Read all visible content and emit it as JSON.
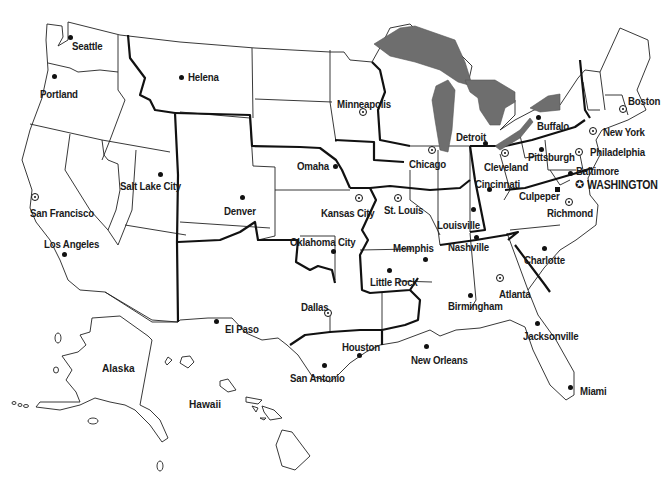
{
  "map": {
    "title": "",
    "regions": [
      {
        "label": "Alaska",
        "x": 102,
        "y": 362
      },
      {
        "label": "Hawaii",
        "x": 189,
        "y": 398
      }
    ],
    "cities": [
      {
        "name": "Seattle",
        "marker": "dot",
        "dot": [
          70,
          37
        ],
        "label": [
          72,
          40
        ]
      },
      {
        "name": "Portland",
        "marker": "dot",
        "dot": [
          54,
          76
        ],
        "label": [
          40,
          88
        ]
      },
      {
        "name": "Helena",
        "marker": "dot",
        "dot": [
          181,
          77
        ],
        "label": [
          188,
          71
        ]
      },
      {
        "name": "Salt Lake City",
        "marker": "dot",
        "dot": [
          160,
          174
        ],
        "label": [
          120,
          180
        ]
      },
      {
        "name": "San Francisco",
        "marker": "ring",
        "dot": [
          35,
          197
        ],
        "label": [
          30,
          207
        ]
      },
      {
        "name": "Los Angeles",
        "marker": "dot",
        "dot": [
          64,
          254
        ],
        "label": [
          44,
          238
        ]
      },
      {
        "name": "Denver",
        "marker": "dot",
        "dot": [
          242,
          197
        ],
        "label": [
          224,
          205
        ]
      },
      {
        "name": "Omaha",
        "marker": "dot",
        "dot": [
          335,
          166
        ],
        "label": [
          297,
          160
        ]
      },
      {
        "name": "Kansas City",
        "marker": "ring",
        "dot": [
          359,
          198
        ],
        "label": [
          321,
          207
        ]
      },
      {
        "name": "Oklahoma City",
        "marker": "dot",
        "dot": [
          333,
          251
        ],
        "label": [
          290,
          236
        ]
      },
      {
        "name": "Dallas",
        "marker": "ring",
        "dot": [
          328,
          313
        ],
        "label": [
          301,
          301
        ]
      },
      {
        "name": "El Paso",
        "marker": "dot",
        "dot": [
          216,
          321
        ],
        "label": [
          225,
          323
        ]
      },
      {
        "name": "San Antonio",
        "marker": "dot",
        "dot": [
          324,
          365
        ],
        "label": [
          290,
          372
        ]
      },
      {
        "name": "Houston",
        "marker": "dot",
        "dot": [
          359,
          355
        ],
        "label": [
          342,
          341
        ]
      },
      {
        "name": "New Orleans",
        "marker": "dot",
        "dot": [
          426,
          346
        ],
        "label": [
          411,
          354
        ]
      },
      {
        "name": "Minneapolis",
        "marker": "ring",
        "dot": [
          363,
          112
        ],
        "label": [
          337,
          98
        ]
      },
      {
        "name": "Chicago",
        "marker": "ring",
        "dot": [
          432,
          150
        ],
        "label": [
          409,
          158
        ]
      },
      {
        "name": "Detroit",
        "marker": "dot",
        "dot": [
          485,
          143
        ],
        "label": [
          456,
          131
        ]
      },
      {
        "name": "St. Louis",
        "marker": "ring",
        "dot": [
          398,
          198
        ],
        "label": [
          384,
          204
        ]
      },
      {
        "name": "Louisville",
        "marker": "dot",
        "dot": [
          473,
          209
        ],
        "label": [
          437,
          219
        ]
      },
      {
        "name": "Memphis",
        "marker": "dot",
        "dot": [
          425,
          259
        ],
        "label": [
          393,
          242
        ]
      },
      {
        "name": "Little Rock",
        "marker": "dot",
        "dot": [
          389,
          270
        ],
        "label": [
          370,
          276
        ]
      },
      {
        "name": "Nashville",
        "marker": "dot",
        "dot": [
          476,
          237
        ],
        "label": [
          448,
          241
        ]
      },
      {
        "name": "Birmingham",
        "marker": "dot",
        "dot": [
          470,
          295
        ],
        "label": [
          448,
          300
        ]
      },
      {
        "name": "Atlanta",
        "marker": "ring",
        "dot": [
          500,
          278
        ],
        "label": [
          499,
          288
        ]
      },
      {
        "name": "Charlotte",
        "marker": "dot",
        "dot": [
          544,
          248
        ],
        "label": [
          524,
          254
        ]
      },
      {
        "name": "Jacksonville",
        "marker": "dot",
        "dot": [
          537,
          323
        ],
        "label": [
          523,
          330
        ]
      },
      {
        "name": "Miami",
        "marker": "dot",
        "dot": [
          570,
          387
        ],
        "label": [
          580,
          385
        ]
      },
      {
        "name": "Cleveland",
        "marker": "ring",
        "dot": [
          505,
          153
        ],
        "label": [
          484,
          161
        ]
      },
      {
        "name": "Cincinnati",
        "marker": "dot",
        "dot": [
          489,
          189
        ],
        "label": [
          475,
          178
        ]
      },
      {
        "name": "Pittsburgh",
        "marker": "dot",
        "dot": [
          541,
          149
        ],
        "label": [
          528,
          151
        ]
      },
      {
        "name": "Buffalo",
        "marker": "dot",
        "dot": [
          538,
          117
        ],
        "label": [
          537,
          120
        ]
      },
      {
        "name": "Culpeper",
        "marker": "square",
        "dot": [
          557,
          189
        ],
        "label": [
          519,
          190
        ]
      },
      {
        "name": "Richmond",
        "marker": "ring",
        "dot": [
          569,
          202
        ],
        "label": [
          547,
          207
        ]
      },
      {
        "name": "Baltimore",
        "marker": "dot",
        "dot": [
          570,
          173
        ],
        "label": [
          576,
          165
        ]
      },
      {
        "name": "Philadelphia",
        "marker": "ring",
        "dot": [
          579,
          152
        ],
        "label": [
          590,
          146
        ]
      },
      {
        "name": "New York",
        "marker": "ring",
        "dot": [
          593,
          131
        ],
        "label": [
          603,
          126
        ]
      },
      {
        "name": "Boston",
        "marker": "ring",
        "dot": [
          623,
          109
        ],
        "label": [
          628,
          95
        ]
      },
      {
        "name": "WASHINGTON",
        "marker": "star",
        "dot": [
          580,
          184
        ],
        "label": [
          587,
          179
        ],
        "capital": true
      }
    ]
  },
  "colors": {
    "lakes": "#6e6e6e",
    "state_border": "#222222",
    "district_border": "#111111",
    "background": "#ffffff"
  }
}
